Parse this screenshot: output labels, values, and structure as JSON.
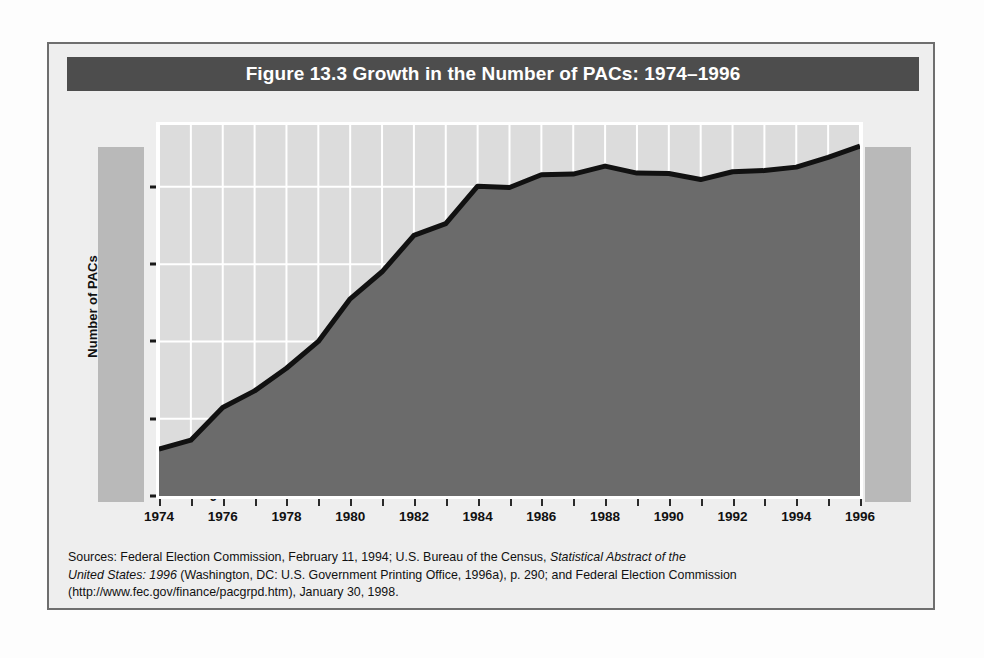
{
  "figure": {
    "title": "Figure 13.3  Growth in the Number of PACs: 1974–1996",
    "title_bar_color": "#4d4d4d",
    "frame_background": "#eeeeee"
  },
  "source_note": {
    "line1_a": "Sources: Federal Election Commission, February 11, 1994; U.S. Bureau of the Census, ",
    "line1_italic": "Statistical Abstract of the",
    "line2_italic": "United States: 1996",
    "line2_b": " (Washington, DC: U.S. Government Printing Office, 1996a), p. 290; and Federal Election Commission",
    "line3": "(http://www.fec.gov/finance/pacgrpd.htm), January 30, 1998."
  },
  "chart_data": {
    "type": "area",
    "title": "Figure 13.3  Growth in the Number of PACs: 1974–1996",
    "xlabel": "",
    "ylabel": "Number of PACs",
    "xlim": [
      1974,
      1996
    ],
    "ylim": [
      0,
      4800
    ],
    "grid": true,
    "legend": "none",
    "area_fill_color": "#6b6b6b",
    "line_color": "#111111",
    "plot_background": "#dcdcdc",
    "gridline_color": "#ffffff",
    "y_ticks": [
      0,
      1000,
      2000,
      3000,
      4000
    ],
    "y_tick_labels": [
      "0",
      "1,000",
      "2,000",
      "3,000",
      "4,000"
    ],
    "x_ticks": [
      1974,
      1975,
      1976,
      1977,
      1978,
      1979,
      1980,
      1981,
      1982,
      1983,
      1984,
      1985,
      1986,
      1987,
      1988,
      1989,
      1990,
      1991,
      1992,
      1993,
      1994,
      1995,
      1996
    ],
    "x_tick_labels_shown": [
      "1974",
      "1976",
      "1978",
      "1980",
      "1982",
      "1984",
      "1986",
      "1988",
      "1990",
      "1992",
      "1994",
      "1996"
    ],
    "x": [
      1974,
      1975,
      1976,
      1977,
      1978,
      1979,
      1980,
      1981,
      1982,
      1983,
      1984,
      1985,
      1986,
      1987,
      1988,
      1989,
      1990,
      1991,
      1992,
      1993,
      1994,
      1995,
      1996
    ],
    "values": [
      608,
      722,
      1146,
      1360,
      1653,
      2000,
      2551,
      2901,
      3371,
      3525,
      4009,
      3992,
      4157,
      4165,
      4268,
      4178,
      4172,
      4094,
      4195,
      4210,
      4255,
      4380,
      4528
    ],
    "series": [
      {
        "name": "Number of PACs",
        "values": [
          608,
          722,
          1146,
          1360,
          1653,
          2000,
          2551,
          2901,
          3371,
          3525,
          4009,
          3992,
          4157,
          4165,
          4268,
          4178,
          4172,
          4094,
          4195,
          4210,
          4255,
          4380,
          4528
        ]
      }
    ]
  }
}
